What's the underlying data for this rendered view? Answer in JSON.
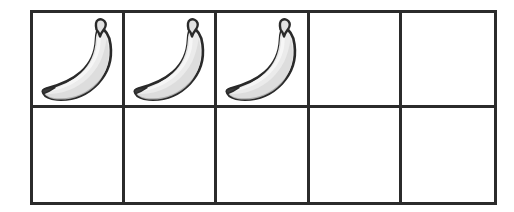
{
  "diagram": {
    "kind": "ten-frame",
    "rows": 2,
    "columns": 5,
    "total_cells": 10,
    "filled_count": 3,
    "empty_count": 7,
    "counter_icon": "banana-icon",
    "counter_label": "banana"
  },
  "colors": {
    "grid_line": "#2b2b2b",
    "background": "#ffffff",
    "banana_outline": "#2a2a2a",
    "banana_fill": "#ebebeb",
    "banana_shade": "#d8d8d8",
    "banana_highlight": "#f7f7f7",
    "banana_tip": "#3a3a3a",
    "banana_stem": "#e2e2e2"
  },
  "chart_data": {
    "type": "table",
    "rows": 2,
    "columns": 5,
    "cells": [
      {
        "row": 1,
        "column": 1,
        "filled": true,
        "content": "banana"
      },
      {
        "row": 1,
        "column": 2,
        "filled": true,
        "content": "banana"
      },
      {
        "row": 1,
        "column": 3,
        "filled": true,
        "content": "banana"
      },
      {
        "row": 1,
        "column": 4,
        "filled": false,
        "content": ""
      },
      {
        "row": 1,
        "column": 5,
        "filled": false,
        "content": ""
      },
      {
        "row": 2,
        "column": 1,
        "filled": false,
        "content": ""
      },
      {
        "row": 2,
        "column": 2,
        "filled": false,
        "content": ""
      },
      {
        "row": 2,
        "column": 3,
        "filled": false,
        "content": ""
      },
      {
        "row": 2,
        "column": 4,
        "filled": false,
        "content": ""
      },
      {
        "row": 2,
        "column": 5,
        "filled": false,
        "content": ""
      }
    ],
    "counts": {
      "filled": 3,
      "empty": 7,
      "total": 10
    }
  }
}
